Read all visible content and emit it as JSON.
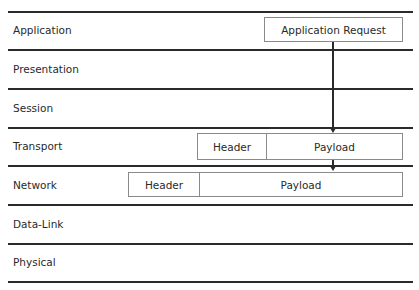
{
  "diagram": {
    "layers": [
      {
        "name": "Application"
      },
      {
        "name": "Presentation"
      },
      {
        "name": "Session"
      },
      {
        "name": "Transport"
      },
      {
        "name": "Network"
      },
      {
        "name": "Data-Link"
      },
      {
        "name": "Physical"
      }
    ],
    "application_box": {
      "label": "Application Request"
    },
    "transport_box": {
      "header": "Header",
      "payload": "Payload"
    },
    "network_box": {
      "header": "Header",
      "payload": "Payload"
    },
    "arrows": [
      {
        "from": "Application Request",
        "to": "Transport Payload"
      },
      {
        "from": "Transport Payload",
        "to": "Network Payload"
      }
    ]
  }
}
